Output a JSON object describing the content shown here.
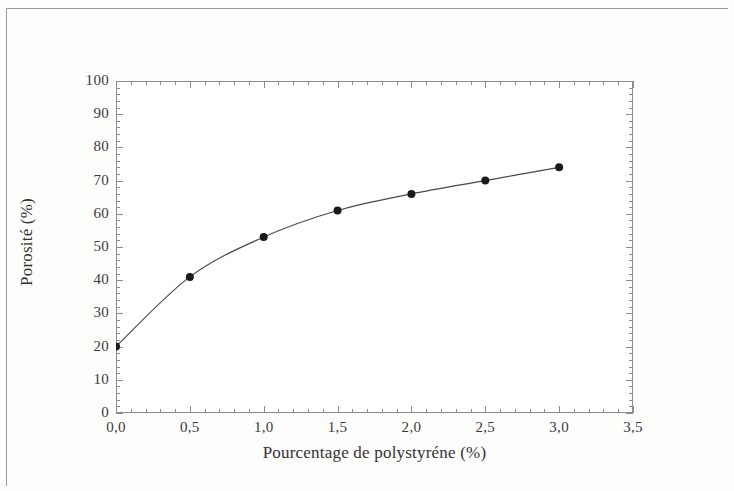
{
  "figure": {
    "kind": "scientific-figure",
    "caption": ""
  },
  "chart_data": {
    "type": "line",
    "title": "",
    "xlabel": "Pourcentage de polystyréne (%)",
    "ylabel": "Porosité (%)",
    "x": [
      0.0,
      0.5,
      1.0,
      1.5,
      2.0,
      2.5,
      3.0
    ],
    "values": [
      20,
      41,
      53,
      61,
      66,
      70,
      74
    ],
    "series": [
      {
        "name": "Porosité",
        "values": [
          20,
          41,
          53,
          61,
          66,
          70,
          74
        ],
        "marker": "filled-circle",
        "marker_color": "#1a1a1a",
        "line_color": "#4a4a4a"
      }
    ],
    "xlim": [
      0.0,
      3.5
    ],
    "ylim": [
      0,
      100
    ],
    "xticks": [
      0.0,
      0.5,
      1.0,
      1.5,
      2.0,
      2.5,
      3.0,
      3.5
    ],
    "yticks": [
      0,
      10,
      20,
      30,
      40,
      50,
      60,
      70,
      80,
      90,
      100
    ],
    "xticklabels": [
      "0,0",
      "0,5",
      "1,0",
      "1,5",
      "2,0",
      "2,5",
      "3,0",
      "3,5"
    ],
    "yticklabels": [
      "0",
      "10",
      "20",
      "30",
      "40",
      "50",
      "60",
      "70",
      "80",
      "90",
      "100"
    ],
    "x_minor_interval": 0.1,
    "y_minor_interval": 2,
    "grid": false,
    "legend": null,
    "frame": "box",
    "tick_direction": "in"
  },
  "colors": {
    "axis": "#8d8d8d",
    "text": "#3a3a3a",
    "line": "#4a4a4a",
    "marker": "#1a1a1a",
    "page_edge": "#9b9b9b",
    "plot_background": "#ffffff",
    "page_background": "#fdfdfc"
  }
}
